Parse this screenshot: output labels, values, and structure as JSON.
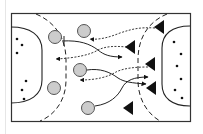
{
  "diagram": {
    "type": "handball-drill",
    "court": {
      "x": 11,
      "y": 13,
      "width": 179,
      "height": 108,
      "line_color": "#333333"
    },
    "colors": {
      "player_fill": "#cccccc",
      "player_stroke": "#555555",
      "defender_fill": "#111111",
      "line": "#222222"
    },
    "attackers": [
      {
        "id": "A1",
        "cx": 55,
        "cy": 37,
        "r": 7
      },
      {
        "id": "A2",
        "cx": 84,
        "cy": 31,
        "r": 7
      },
      {
        "id": "A3",
        "cx": 80,
        "cy": 70,
        "r": 7
      },
      {
        "id": "A4",
        "cx": 54,
        "cy": 88,
        "r": 7
      },
      {
        "id": "A5",
        "cx": 88,
        "cy": 108,
        "r": 7
      }
    ],
    "defenders": [
      {
        "id": "D1",
        "x": 162,
        "y": 27
      },
      {
        "id": "D2",
        "x": 134,
        "y": 47
      },
      {
        "id": "D3",
        "x": 154,
        "y": 64
      },
      {
        "id": "D4",
        "x": 155,
        "y": 88
      },
      {
        "id": "D5",
        "x": 131,
        "y": 108
      }
    ],
    "left_dots": [
      [
        17,
        39
      ],
      [
        22,
        45
      ],
      [
        17,
        53
      ],
      [
        26,
        81
      ],
      [
        22,
        90
      ],
      [
        24,
        99
      ]
    ],
    "right_dots": [
      [
        174,
        42
      ],
      [
        181,
        54
      ],
      [
        177,
        66
      ],
      [
        181,
        79
      ],
      [
        175,
        90
      ],
      [
        182,
        98
      ]
    ]
  }
}
